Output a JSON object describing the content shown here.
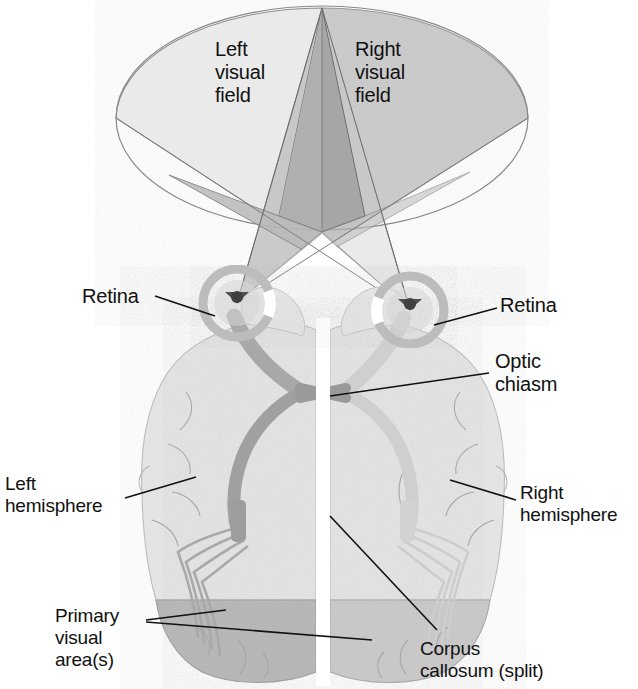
{
  "figure": {
    "type": "anatomical-diagram",
    "background_color": "#ffffff"
  },
  "labels": {
    "left_visual_field": "Left\nvisual\nfield",
    "right_visual_field": "Right\nvisual\nfield",
    "retina_left": "Retina",
    "retina_right": "Retina",
    "optic_chiasm": "Optic\nchiasm",
    "left_hemisphere": "Left\nhemisphere",
    "right_hemisphere": "Right\nhemisphere",
    "primary_visual_area": "Primary\nvisual\narea(s)",
    "corpus_callosum": "Corpus\ncallosum (split)"
  },
  "colors": {
    "page_background": "#ffffff",
    "cone_left_light": "#e8e8e8",
    "cone_right_mid": "#c2c2c2",
    "cone_center_dark": "#a8a8a8",
    "cone_overlap": "#b5b5b5",
    "cone_outline": "#6e6e6e",
    "brain_fill": "#e2e2e2",
    "brain_outline": "#b0b0b0",
    "sulcus_line": "#9a9a9a",
    "optic_tract_dark": "#a0a0a0",
    "optic_tract_light": "#cfcfcf",
    "visual_cortex": "#b4b4b4",
    "eye_ring": "#b8b8b8",
    "pupil": "#4a4a4a",
    "leader_line": "#111111",
    "text": "#111111"
  },
  "structures": [
    {
      "name": "left-visual-field-cone",
      "shade": "light"
    },
    {
      "name": "right-visual-field-cone",
      "shade": "medium"
    },
    {
      "name": "binocular-overlap-wedge",
      "shade": "dark"
    },
    {
      "name": "left-eye-retina",
      "shade": "ring"
    },
    {
      "name": "right-eye-retina",
      "shade": "ring"
    },
    {
      "name": "optic-nerve-left",
      "shade": "dark"
    },
    {
      "name": "optic-nerve-right",
      "shade": "light"
    },
    {
      "name": "optic-chiasm-crossing",
      "shade": "dark"
    },
    {
      "name": "optic-radiation-left",
      "shade": "dark"
    },
    {
      "name": "optic-radiation-right",
      "shade": "light"
    },
    {
      "name": "left-hemisphere-body",
      "shade": "light"
    },
    {
      "name": "right-hemisphere-body",
      "shade": "light"
    },
    {
      "name": "primary-visual-cortex-left",
      "shade": "medium"
    },
    {
      "name": "primary-visual-cortex-right",
      "shade": "medium"
    },
    {
      "name": "corpus-callosum-split-gap",
      "shade": "white"
    }
  ]
}
